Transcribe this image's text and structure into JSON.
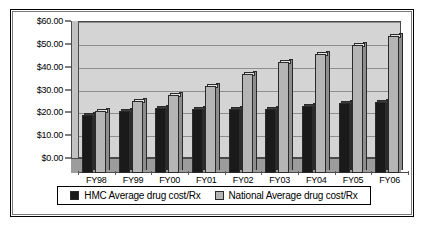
{
  "chart_data": {
    "type": "bar",
    "title": "",
    "xlabel": "",
    "ylabel": "",
    "ylim": [
      0,
      60
    ],
    "ytick_values": [
      60,
      50,
      40,
      30,
      20,
      10,
      0
    ],
    "ytick_labels": [
      "$60.00",
      "$50.00",
      "$40.00",
      "$30.00",
      "$20.00",
      "$10.00",
      "$0.00"
    ],
    "grid": true,
    "legend_position": "bottom",
    "style": "3d-clustered-column",
    "categories": [
      "FY98",
      "FY99",
      "FY00",
      "FY01",
      "FY02",
      "FY03",
      "FY04",
      "FY05",
      "FY06"
    ],
    "series": [
      {
        "name": "HMC Average drug cost/Rx",
        "color": "#1a1a1a",
        "values": [
          25.5,
          27.0,
          28.5,
          28.0,
          28.0,
          28.0,
          29.5,
          30.5,
          31.0
        ]
      },
      {
        "name": "National Average drug cost/Rx",
        "color": "#b5b5b5",
        "values": [
          27.0,
          31.5,
          34.0,
          38.0,
          43.5,
          48.5,
          52.0,
          56.0,
          60.0
        ]
      }
    ]
  },
  "legend": {
    "items": [
      {
        "label": "HMC Average drug cost/Rx",
        "swatch": "black-square-icon"
      },
      {
        "label": "National Average drug cost/Rx",
        "swatch": "gray-square-icon"
      }
    ]
  }
}
